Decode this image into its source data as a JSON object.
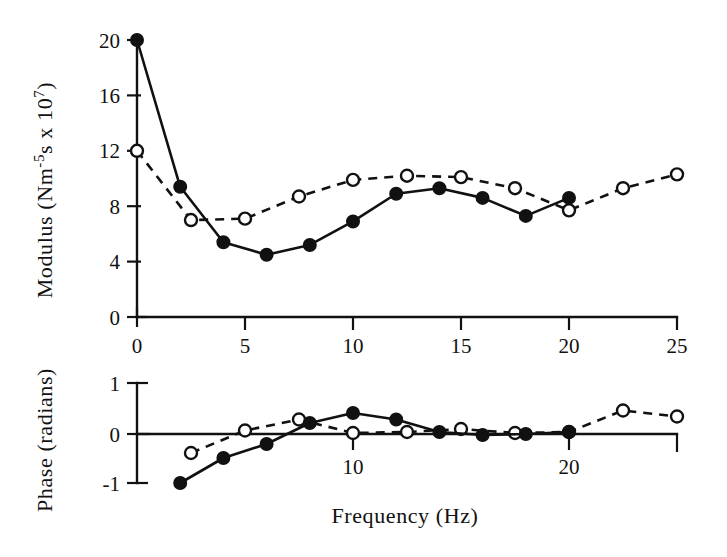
{
  "figure": {
    "title": "",
    "background_color": "#ffffff",
    "ink_color": "#111111"
  },
  "modulus_axis_title": "Modulus (Nm",
  "modulus_axis_title_sup1": "-5",
  "modulus_axis_title_mid": "s x 10",
  "modulus_axis_title_sup2": "7",
  "modulus_axis_title_end": ")",
  "phase_axis_title": "Phase (radians)",
  "xaxis_title": "Frequency (Hz)",
  "modulus_yticks": [
    "0",
    "4",
    "8",
    "12",
    "16",
    "20"
  ],
  "modulus_xticks": [
    "0",
    "5",
    "10",
    "15",
    "20",
    "25"
  ],
  "phase_yticks": [
    "-1",
    "0",
    "1"
  ],
  "phase_xticks": [
    "10",
    "20"
  ],
  "legend": {
    "series_filled_name": "filled-circle-solid-line",
    "series_open_name": "open-circle-dashed-line"
  },
  "chart_data": [
    {
      "type": "line",
      "id": "modulus-panel",
      "title": "",
      "xlabel": "Frequency (Hz)",
      "ylabel": "Modulus (Nm-5s x 107)",
      "xlim": [
        0,
        25
      ],
      "ylim": [
        0,
        20
      ],
      "xticks": [
        0,
        5,
        10,
        15,
        20,
        25
      ],
      "yticks": [
        0,
        4,
        8,
        12,
        16,
        20
      ],
      "grid": false,
      "legend_position": "none",
      "series": [
        {
          "name": "filled-circle-solid",
          "marker": "filled-circle",
          "linestyle": "solid",
          "x": [
            0,
            2,
            4,
            6,
            8,
            10,
            12,
            14,
            16,
            18,
            20
          ],
          "y": [
            20.0,
            9.4,
            5.4,
            4.5,
            5.2,
            6.9,
            8.9,
            9.3,
            8.6,
            7.3,
            8.6
          ]
        },
        {
          "name": "open-circle-dashed",
          "marker": "open-circle",
          "linestyle": "dashed",
          "x": [
            0,
            2.5,
            5,
            7.5,
            10,
            12.5,
            15,
            17.5,
            20,
            22.5,
            25
          ],
          "y": [
            12.0,
            7.0,
            7.1,
            8.7,
            9.9,
            10.2,
            10.1,
            9.3,
            7.7,
            9.3,
            10.3
          ]
        }
      ]
    },
    {
      "type": "line",
      "id": "phase-panel",
      "title": "",
      "xlabel": "Frequency (Hz)",
      "ylabel": "Phase (radians)",
      "xlim": [
        0,
        25
      ],
      "ylim": [
        -1,
        1
      ],
      "xticks": [
        10,
        20
      ],
      "yticks": [
        -1,
        0,
        1
      ],
      "grid": false,
      "legend_position": "none",
      "series": [
        {
          "name": "filled-circle-solid",
          "marker": "filled-circle",
          "linestyle": "solid",
          "x": [
            2,
            4,
            6,
            8,
            10,
            12,
            14,
            16,
            18,
            20
          ],
          "y": [
            -1.0,
            -0.5,
            -0.22,
            0.2,
            0.4,
            0.27,
            0.02,
            -0.04,
            -0.02,
            0.02
          ]
        },
        {
          "name": "open-circle-dashed",
          "marker": "open-circle",
          "linestyle": "dashed",
          "x": [
            2.5,
            5,
            7.5,
            10,
            12.5,
            15,
            17.5,
            20,
            22.5,
            25
          ],
          "y": [
            -0.4,
            0.05,
            0.27,
            0.0,
            0.02,
            0.08,
            0.0,
            0.02,
            0.45,
            0.33
          ]
        }
      ]
    }
  ]
}
